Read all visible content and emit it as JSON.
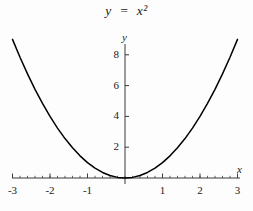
{
  "chart_data": {
    "type": "line",
    "title": "y  =  x²",
    "xlabel": "x",
    "ylabel": "y",
    "function": "y = x^2",
    "xlim": [
      -3.15,
      3.15
    ],
    "ylim": [
      0,
      9.7
    ],
    "grid": false,
    "legend": null,
    "line_color": "#000000",
    "axis_color": "#3b3b3b",
    "x_ticks": [
      {
        "value": -3,
        "label": "-3"
      },
      {
        "value": -2,
        "label": "-2"
      },
      {
        "value": -1,
        "label": "-1"
      },
      {
        "value": 1,
        "label": "1"
      },
      {
        "value": 2,
        "label": "2"
      },
      {
        "value": 3,
        "label": "3"
      }
    ],
    "y_ticks": [
      {
        "value": 2,
        "label": "2"
      },
      {
        "value": 4,
        "label": "4"
      },
      {
        "value": 6,
        "label": "6"
      },
      {
        "value": 8,
        "label": "8"
      }
    ],
    "x_minor_tick_step": 0.2,
    "points": [
      {
        "x": -3.0,
        "y": 9.0
      },
      {
        "x": -2.8,
        "y": 7.84
      },
      {
        "x": -2.6,
        "y": 6.76
      },
      {
        "x": -2.4,
        "y": 5.76
      },
      {
        "x": -2.2,
        "y": 4.84
      },
      {
        "x": -2.0,
        "y": 4.0
      },
      {
        "x": -1.8,
        "y": 3.24
      },
      {
        "x": -1.6,
        "y": 2.56
      },
      {
        "x": -1.4,
        "y": 1.96
      },
      {
        "x": -1.2,
        "y": 1.44
      },
      {
        "x": -1.0,
        "y": 1.0
      },
      {
        "x": -0.8,
        "y": 0.64
      },
      {
        "x": -0.6,
        "y": 0.36
      },
      {
        "x": -0.4,
        "y": 0.16
      },
      {
        "x": -0.2,
        "y": 0.04
      },
      {
        "x": 0.0,
        "y": 0.0
      },
      {
        "x": 0.2,
        "y": 0.04
      },
      {
        "x": 0.4,
        "y": 0.16
      },
      {
        "x": 0.6,
        "y": 0.36
      },
      {
        "x": 0.8,
        "y": 0.64
      },
      {
        "x": 1.0,
        "y": 1.0
      },
      {
        "x": 1.2,
        "y": 1.44
      },
      {
        "x": 1.4,
        "y": 1.96
      },
      {
        "x": 1.6,
        "y": 2.56
      },
      {
        "x": 1.8,
        "y": 3.24
      },
      {
        "x": 2.0,
        "y": 4.0
      },
      {
        "x": 2.2,
        "y": 4.84
      },
      {
        "x": 2.4,
        "y": 5.76
      },
      {
        "x": 2.6,
        "y": 6.76
      },
      {
        "x": 2.8,
        "y": 7.84
      },
      {
        "x": 3.0,
        "y": 9.0
      }
    ]
  },
  "geometry": {
    "origin_x": 125,
    "origin_y": 178,
    "px_per_unit_x": 37.5,
    "px_per_unit_y": 15.4,
    "x_axis_left": 12,
    "x_axis_right": 240,
    "y_axis_top": 44
  }
}
